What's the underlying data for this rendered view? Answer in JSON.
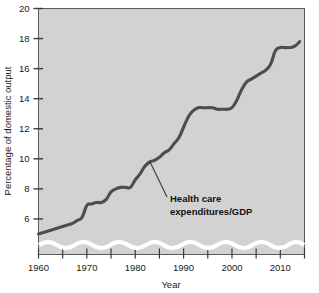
{
  "chart_data": {
    "type": "line",
    "title": "",
    "xlabel": "Year",
    "ylabel": "Percentage of domestic output",
    "xlim": [
      1960,
      2015
    ],
    "ylim": [
      4.6,
      20
    ],
    "grid": false,
    "legend_position": "none",
    "axis_break": true,
    "y_ticks": [
      6,
      8,
      10,
      12,
      14,
      16,
      18,
      20
    ],
    "y_tick_labels": [
      "6",
      "8",
      "10",
      "12",
      "14",
      "16",
      "18",
      "20"
    ],
    "x_ticks": [
      1960,
      1965,
      1970,
      1975,
      1980,
      1985,
      1990,
      1995,
      2000,
      2005,
      2010,
      2015
    ],
    "x_tick_labels": [
      "1960",
      "",
      "1970",
      "",
      "1980",
      "",
      "1990",
      "",
      "2000",
      "",
      "2010",
      ""
    ],
    "x_major_labels": [
      "1960",
      "1970",
      "1980",
      "1990",
      "2000",
      "2010"
    ],
    "annotations": [
      {
        "text_line1": "Health care",
        "text_line2": "expenditures/GDP",
        "points_to_year": 1983,
        "points_to_value": 10.1
      }
    ],
    "series": [
      {
        "name": "Health care expenditures/GDP",
        "color": "#4d4d4d",
        "x": [
          1960,
          1961,
          1962,
          1963,
          1964,
          1965,
          1966,
          1967,
          1968,
          1969,
          1970,
          1971,
          1972,
          1973,
          1974,
          1975,
          1976,
          1977,
          1978,
          1979,
          1980,
          1981,
          1982,
          1983,
          1984,
          1985,
          1986,
          1987,
          1988,
          1989,
          1990,
          1991,
          1992,
          1993,
          1994,
          1995,
          1996,
          1997,
          1998,
          1999,
          2000,
          2001,
          2002,
          2003,
          2004,
          2005,
          2006,
          2007,
          2008,
          2009,
          2010,
          2011,
          2012,
          2013,
          2014
        ],
        "values": [
          5.0,
          5.1,
          5.2,
          5.3,
          5.4,
          5.5,
          5.6,
          5.7,
          5.9,
          6.1,
          6.9,
          7.0,
          7.1,
          7.1,
          7.3,
          7.8,
          8.0,
          8.1,
          8.1,
          8.1,
          8.6,
          9.0,
          9.5,
          9.8,
          9.9,
          10.1,
          10.4,
          10.6,
          11.0,
          11.4,
          12.1,
          12.8,
          13.2,
          13.4,
          13.4,
          13.4,
          13.4,
          13.3,
          13.3,
          13.3,
          13.4,
          13.9,
          14.6,
          15.1,
          15.3,
          15.5,
          15.7,
          15.9,
          16.3,
          17.2,
          17.4,
          17.4,
          17.4,
          17.5,
          17.8
        ]
      }
    ]
  },
  "figure": {
    "background_color": "#ffffff",
    "plot_fill_color": "#d2d2d2",
    "frame_color": "#555555",
    "line_color": "#4d4d4d",
    "break_band_color": "#ffffff"
  }
}
